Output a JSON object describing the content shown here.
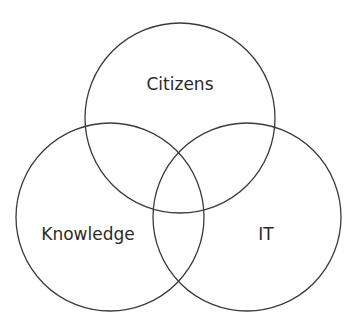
{
  "diagram": {
    "type": "venn",
    "stroke_color": "#3a3a3a",
    "text_color": "#2a2a2a",
    "sets": [
      {
        "id": "citizens",
        "label": "Citizens",
        "cx": 180,
        "cy": 118,
        "r": 95,
        "label_x": 180,
        "label_y": 90
      },
      {
        "id": "knowledge",
        "label": "Knowledge",
        "cx": 110,
        "cy": 217,
        "r": 94,
        "label_x": 88,
        "label_y": 240
      },
      {
        "id": "it",
        "label": "IT",
        "cx": 247,
        "cy": 217,
        "r": 94,
        "label_x": 266,
        "label_y": 240
      }
    ]
  }
}
